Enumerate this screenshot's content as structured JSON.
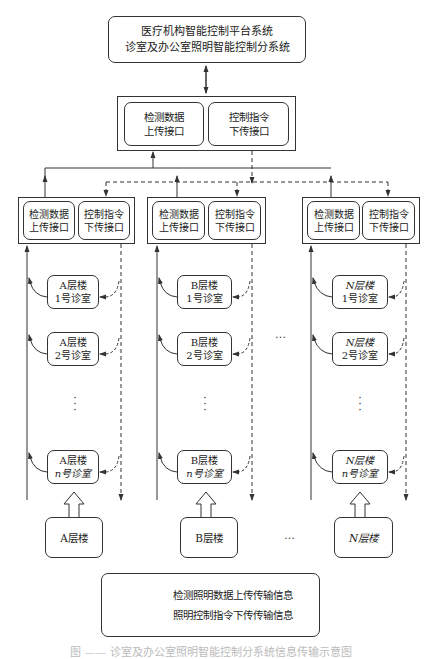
{
  "top_system": {
    "line1": "医疗机构智能控制平台系统",
    "line2": "诊室及办公室照明智能控制分系统"
  },
  "central_interface": {
    "upload": "检测数据\n上传接口",
    "download": "控制指令\n下传接口"
  },
  "columns": [
    {
      "id": "A",
      "interface_upload": "检测数据\n上传接口",
      "interface_download": "控制指令\n下传接口",
      "rooms": [
        {
          "floor": "A层楼",
          "room": "1号诊室"
        },
        {
          "floor": "A层楼",
          "room": "2号诊室"
        },
        {
          "floor": "A层楼",
          "room": "n号诊室"
        }
      ],
      "floor_label": "A层楼"
    },
    {
      "id": "B",
      "interface_upload": "检测数据\n上传接口",
      "interface_download": "控制指令\n下传接口",
      "rooms": [
        {
          "floor": "B层楼",
          "room": "1号诊室"
        },
        {
          "floor": "B层楼",
          "room": "2号诊室"
        },
        {
          "floor": "B层楼",
          "room": "n号诊室"
        }
      ],
      "floor_label": "B层楼"
    },
    {
      "id": "N",
      "interface_upload": "检测数据\n上传接口",
      "interface_download": "控制指令\n下传接口",
      "rooms": [
        {
          "floor": "N层楼",
          "room": "1号诊室"
        },
        {
          "floor": "N层楼",
          "room": "2号诊室"
        },
        {
          "floor": "N层楼",
          "room": "n号诊室"
        }
      ],
      "floor_label": "N层楼"
    }
  ],
  "ellipsis": "…",
  "vertical_ellipsis": "⋮",
  "legend": {
    "solid_label": "检测照明数据上传传输信息",
    "dashed_label": "照明控制指令下传传输信息"
  },
  "caption": "图 —— 诊室及办公室照明智能控制分系统信息传输示意图",
  "colors": {
    "line": "#333333",
    "background": "#ffffff"
  }
}
